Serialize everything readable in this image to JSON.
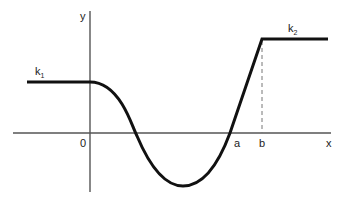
{
  "diagram": {
    "axes": {
      "x_label": "x",
      "y_label": "y",
      "origin_label": "0"
    },
    "tick_labels": {
      "a": "a",
      "b": "b"
    },
    "levels": {
      "k1": {
        "base": "k",
        "subscript": "1"
      },
      "k2": {
        "base": "k",
        "subscript": "2"
      }
    },
    "colors": {
      "curve": "#111111",
      "axis": "#555555",
      "dashed": "#777777"
    }
  }
}
